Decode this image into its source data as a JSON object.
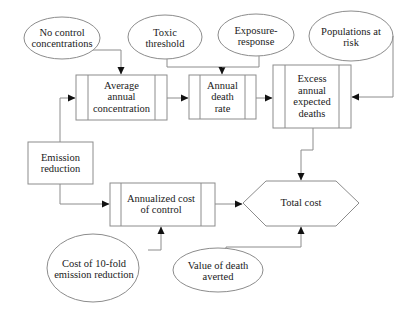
{
  "diagram": {
    "type": "flowchart",
    "inputs": [
      {
        "id": "no-control",
        "label": "No control concentrations",
        "lines": [
          "No control",
          "concentrations"
        ]
      },
      {
        "id": "toxic",
        "label": "Toxic threshold",
        "lines": [
          "Toxic",
          "threshold"
        ]
      },
      {
        "id": "exposure",
        "label": "Exposure-response",
        "lines": [
          "Exposure-",
          "response"
        ]
      },
      {
        "id": "populations",
        "label": "Populations at risk",
        "lines": [
          "Populations at",
          "risk"
        ]
      },
      {
        "id": "cost10",
        "label": "Cost of 10-fold emission reduction",
        "lines": [
          "Cost of 10-fold",
          "emission reduction"
        ]
      },
      {
        "id": "vdeath",
        "label": "Value of death averted",
        "lines": [
          "Value of death",
          "averted"
        ]
      }
    ],
    "decision": {
      "id": "emission",
      "label": "Emission reduction",
      "lines": [
        "Emission",
        "reduction"
      ]
    },
    "processes": [
      {
        "id": "avgconc",
        "label": "Average annual concentration",
        "lines": [
          "Average",
          "annual",
          "concentration"
        ]
      },
      {
        "id": "deathrate",
        "label": "Annual death rate",
        "lines": [
          "Annual",
          "death",
          "rate"
        ]
      },
      {
        "id": "excess",
        "label": "Excess annual expected deaths",
        "lines": [
          "Excess",
          "annual",
          "expected",
          "deaths"
        ]
      },
      {
        "id": "annualcost",
        "label": "Annualized cost of control",
        "lines": [
          "Annualized cost",
          "of control"
        ]
      }
    ],
    "output": {
      "id": "total",
      "label": "Total cost"
    },
    "edges": [
      [
        "No control concentrations",
        "Average annual concentration"
      ],
      [
        "Emission reduction",
        "Average annual concentration"
      ],
      [
        "Average annual concentration",
        "Annual death rate"
      ],
      [
        "Toxic threshold",
        "Annual death rate"
      ],
      [
        "Exposure-response",
        "Annual death rate"
      ],
      [
        "Annual death rate",
        "Excess annual expected deaths"
      ],
      [
        "Populations at risk",
        "Excess annual expected deaths"
      ],
      [
        "Excess annual expected deaths",
        "Total cost"
      ],
      [
        "Emission reduction",
        "Annualized cost of control"
      ],
      [
        "Cost of 10-fold emission reduction",
        "Annualized cost of control"
      ],
      [
        "Annualized cost of control",
        "Total cost"
      ],
      [
        "Value of death averted",
        "Total cost"
      ]
    ]
  },
  "labels": {
    "no_control_1": "No control",
    "no_control_2": "concentrations",
    "toxic_1": "Toxic",
    "toxic_2": "threshold",
    "exposure_1": "Exposure-",
    "exposure_2": "response",
    "pop_1": "Populations at",
    "pop_2": "risk",
    "avg_1": "Average",
    "avg_2": "annual",
    "avg_3": "concentration",
    "rate_1": "Annual",
    "rate_2": "death",
    "rate_3": "rate",
    "excess_1": "Excess",
    "excess_2": "annual",
    "excess_3": "expected",
    "excess_4": "deaths",
    "emission_1": "Emission",
    "emission_2": "reduction",
    "annual_1": "Annualized cost",
    "annual_2": "of control",
    "total": "Total cost",
    "cost10_1": "Cost of 10-fold",
    "cost10_2": "emission reduction",
    "vdeath_1": "Value of death",
    "vdeath_2": "averted"
  },
  "colors": {
    "stroke": "#8c8c8c",
    "text": "#1a1a1a",
    "background": "#ffffff"
  }
}
